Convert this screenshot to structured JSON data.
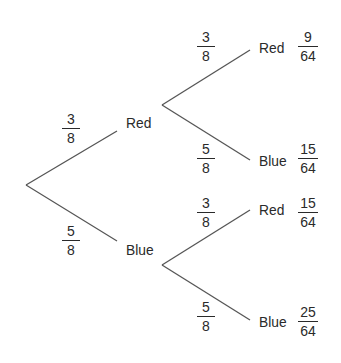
{
  "diagram": {
    "type": "probability-tree",
    "level1": {
      "red": {
        "label": "Red",
        "prob": {
          "num": "3",
          "den": "8"
        }
      },
      "blue": {
        "label": "Blue",
        "prob": {
          "num": "5",
          "den": "8"
        }
      }
    },
    "level2": {
      "red_red": {
        "label": "Red",
        "prob": {
          "num": "3",
          "den": "8"
        },
        "joint": {
          "num": "9",
          "den": "64"
        }
      },
      "red_blue": {
        "label": "Blue",
        "prob": {
          "num": "5",
          "den": "8"
        },
        "joint": {
          "num": "15",
          "den": "64"
        }
      },
      "blue_red": {
        "label": "Red",
        "prob": {
          "num": "3",
          "den": "8"
        },
        "joint": {
          "num": "15",
          "den": "64"
        }
      },
      "blue_blue": {
        "label": "Blue",
        "prob": {
          "num": "5",
          "den": "8"
        },
        "joint": {
          "num": "25",
          "den": "64"
        }
      }
    },
    "line_color": "#555555"
  }
}
